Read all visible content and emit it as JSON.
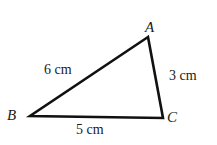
{
  "figure": {
    "type": "triangle",
    "stroke_color": "#111111",
    "vertices": {
      "A": {
        "label": "A",
        "x": 148,
        "y": 37
      },
      "B": {
        "label": "B",
        "x": 30,
        "y": 116
      },
      "C": {
        "label": "C",
        "x": 163,
        "y": 118
      }
    },
    "sides": {
      "AB": {
        "label": "6 cm"
      },
      "AC": {
        "label": "3 cm"
      },
      "BC": {
        "label": "5 cm"
      }
    }
  }
}
